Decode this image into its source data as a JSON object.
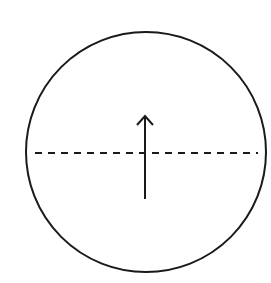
{
  "diagram": {
    "colors": {
      "stroke": "#1a1a1a",
      "background": "#ffffff"
    },
    "circle": {
      "cx": 146,
      "cy": 152,
      "r": 120
    },
    "dashed_line": {
      "x1": 35,
      "y1": 153,
      "x2": 258,
      "y2": 153,
      "dash": "7 6"
    },
    "arrow": {
      "x": 145,
      "y_tail": 199,
      "y_tip": 116,
      "direction": "up"
    }
  }
}
